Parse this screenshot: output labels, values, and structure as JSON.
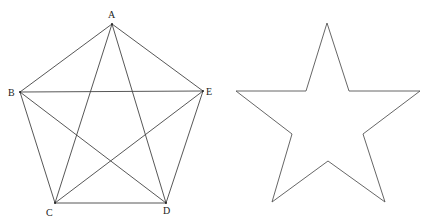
{
  "figures": [
    {
      "name": "pentagon-with-diagonals",
      "stroke": "#444444",
      "vertices": [
        {
          "label": "A",
          "x": 112,
          "y": 24,
          "lx": 108,
          "ly": 18
        },
        {
          "label": "B",
          "x": 20,
          "y": 92,
          "lx": 8,
          "ly": 96
        },
        {
          "label": "C",
          "x": 55,
          "y": 203,
          "lx": 46,
          "ly": 216
        },
        {
          "label": "D",
          "x": 166,
          "y": 203,
          "lx": 163,
          "ly": 214
        },
        {
          "label": "E",
          "x": 203,
          "y": 91,
          "lx": 206,
          "ly": 95
        }
      ],
      "edges": [
        [
          "A",
          "B"
        ],
        [
          "B",
          "C"
        ],
        [
          "C",
          "D"
        ],
        [
          "D",
          "E"
        ],
        [
          "E",
          "A"
        ],
        [
          "A",
          "C"
        ],
        [
          "A",
          "D"
        ],
        [
          "B",
          "D"
        ],
        [
          "B",
          "E"
        ],
        [
          "C",
          "E"
        ]
      ]
    },
    {
      "name": "star",
      "stroke": "#555555",
      "points": [
        [
          327,
          23
        ],
        [
          349,
          91
        ],
        [
          420,
          91
        ],
        [
          363,
          134
        ],
        [
          385,
          202
        ],
        [
          328,
          161
        ],
        [
          272,
          202
        ],
        [
          292,
          134
        ],
        [
          236,
          91
        ],
        [
          306,
          91
        ]
      ]
    }
  ]
}
